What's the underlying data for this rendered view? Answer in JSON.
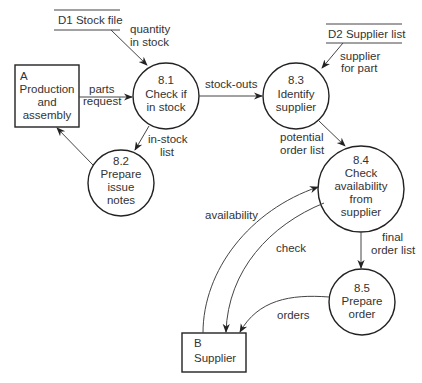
{
  "diagram": {
    "type": "data-flow-diagram",
    "stores": [
      {
        "id": "D1",
        "label": "D1 Stock file"
      },
      {
        "id": "D2",
        "label": "D2 Supplier list"
      }
    ],
    "entities": [
      {
        "id": "A",
        "lines": [
          "A",
          "Production",
          "and",
          "assembly"
        ]
      },
      {
        "id": "B",
        "lines": [
          "B",
          "Supplier"
        ]
      }
    ],
    "processes": [
      {
        "id": "8.1",
        "lines": [
          "8.1",
          "Check if",
          "in stock"
        ]
      },
      {
        "id": "8.2",
        "lines": [
          "8.2",
          "Prepare",
          "issue",
          "notes"
        ]
      },
      {
        "id": "8.3",
        "lines": [
          "8.3",
          "Identify",
          "supplier"
        ]
      },
      {
        "id": "8.4",
        "lines": [
          "8.4",
          "Check",
          "availability",
          "from",
          "supplier"
        ]
      },
      {
        "id": "8.5",
        "lines": [
          "8.5",
          "Prepare",
          "order"
        ]
      }
    ],
    "flows": [
      {
        "from": "D1",
        "to": "8.1",
        "lines": [
          "quantity",
          "in stock"
        ]
      },
      {
        "from": "A",
        "to": "8.1",
        "lines": [
          "parts",
          "request"
        ]
      },
      {
        "from": "8.1",
        "to": "8.3",
        "lines": [
          "stock-outs"
        ]
      },
      {
        "from": "8.1",
        "to": "8.2",
        "lines": [
          "in-stock",
          "list"
        ]
      },
      {
        "from": "8.2",
        "to": "A",
        "lines": []
      },
      {
        "from": "D2",
        "to": "8.3",
        "lines": [
          "supplier",
          "for part"
        ]
      },
      {
        "from": "8.3",
        "to": "8.4",
        "lines": [
          "potential",
          "order list"
        ]
      },
      {
        "from": "B",
        "to": "8.4",
        "lines": [
          "availability"
        ]
      },
      {
        "from": "8.4",
        "to": "B",
        "lines": [
          "check"
        ]
      },
      {
        "from": "8.4",
        "to": "8.5",
        "lines": [
          "final",
          "order list"
        ]
      },
      {
        "from": "8.5",
        "to": "B",
        "lines": [
          "orders"
        ]
      }
    ]
  }
}
